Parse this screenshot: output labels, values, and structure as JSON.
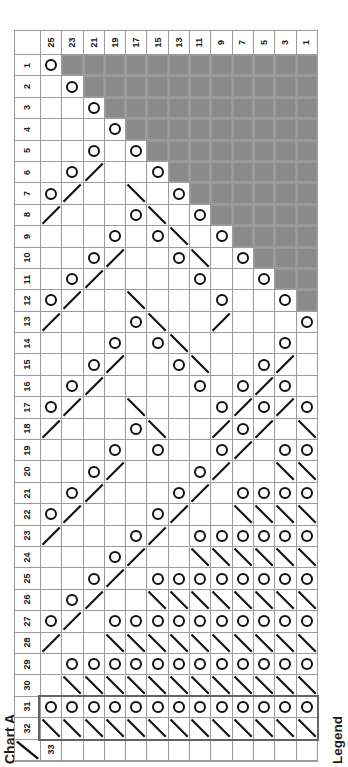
{
  "chart_data": {
    "type": "table",
    "title": "Chart A",
    "legend_label": "Legend",
    "col_headers": [
      "25",
      "23",
      "21",
      "19",
      "17",
      "15",
      "13",
      "11",
      "9",
      "7",
      "5",
      "3",
      "1"
    ],
    "row_headers": [
      "1",
      "2",
      "3",
      "4",
      "5",
      "6",
      "7",
      "8",
      "9",
      "10",
      "11",
      "12",
      "13",
      "14",
      "15",
      "16",
      "17",
      "18",
      "19",
      "20",
      "21",
      "22",
      "23",
      "24",
      "25",
      "26",
      "27",
      "28",
      "29",
      "30",
      "31",
      "32",
      "33"
    ],
    "grid": [
      "O############",
      ".O###########",
      "..O##########",
      "...O#########",
      "..O.O########",
      ".O/..O#######",
      "O/..\\.O######",
      "/...O\\.O#####",
      "...O.O\\.O####",
      "..O/..O\\.O###",
      ".O/....O..O##",
      "O/..\\...O..O#",
      "/...O\\../...O",
      "...O.O\\....O.",
      "..O/..O\\..O/.",
      ".O/....O.O/O.",
      "O/..\\...O/O/O",
      "/...O\\../O/.\\",
      "...O.O..O/.OO",
      "..O/...O/..\\\\",
      ".O/...O/.OOOO",
      "O/...O/..\\\\\\\\",
      "/...O/.OOOOOO",
      "...O/..\\\\\\\\\\\\",
      "..O/.OOOOOOOO",
      ".O/..\\\\\\\\\\\\\\\\",
      "O/.OOOOOOOOOO",
      "/..\\\\\\\\\\\\\\\\\\\\",
      ".OOOOOOOOOOOO",
      ".\\\\\\\\\\\\\\\\\\\\\\\\",
      "OOOOOOOOOOOOO",
      "\\\\\\\\\\\\\\\\\\\\\\\\\\\\",
      "............."
    ],
    "symbol_names": {
      "O": "yarn-over-icon",
      "/": "decrease-slash-icon",
      "\\": "decrease-backslash-icon",
      "#": "no-stitch-cell",
      ".": "empty-cell"
    },
    "repeat_box_rows": [
      31,
      32
    ],
    "colors": {
      "no_stitch_fill": "#8a8a8a",
      "grid_line": "#9a9a9a",
      "symbol": "#111111",
      "repeat_box_border": "#636363"
    }
  }
}
